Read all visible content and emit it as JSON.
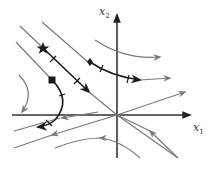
{
  "diagram": {
    "type": "phase-portrait",
    "axes": {
      "horizontal": {
        "label": "x",
        "subscript": "1"
      },
      "vertical": {
        "label": "x",
        "subscript": "2"
      }
    },
    "colors": {
      "axis": "#333333",
      "trajectory_highlight": "#1a1a1a",
      "trajectory_background": "#7a7a7a",
      "background": "#ffffff"
    },
    "markers": [
      {
        "shape": "star",
        "on": "diagonal-highlight-trajectory"
      },
      {
        "shape": "diamond",
        "on": "upper-highlight-trajectory"
      },
      {
        "shape": "square",
        "on": "lower-highlight-trajectory"
      }
    ],
    "highlighted_trajectories": 3,
    "background_trajectories": 9
  }
}
